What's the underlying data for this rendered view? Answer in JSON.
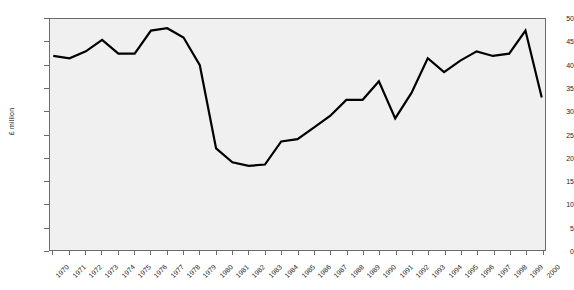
{
  "chart_data": {
    "type": "line",
    "title": "",
    "xlabel": "",
    "ylabel": "£ million",
    "ylim": [
      0,
      50
    ],
    "ytick_step": 5,
    "yticks": [
      0,
      5,
      10,
      15,
      20,
      25,
      30,
      35,
      40,
      45,
      50
    ],
    "grid": false,
    "legend": "none",
    "line_color": "#000000",
    "plot_background": "#f0f0f0",
    "axis_color": "#6b6b6b",
    "categories": [
      "1970",
      "1971",
      "1972",
      "1973",
      "1974",
      "1975",
      "1976",
      "1977",
      "1978",
      "1979",
      "1980",
      "1981",
      "1982",
      "1983",
      "1984",
      "1985",
      "1986",
      "1987",
      "1988",
      "1989",
      "1990",
      "1991",
      "1992",
      "1993",
      "1994",
      "1995",
      "1996",
      "1997",
      "1998",
      "1999",
      "2000"
    ],
    "values": [
      42.0,
      41.5,
      43.0,
      45.5,
      42.5,
      42.5,
      47.5,
      48.0,
      46.0,
      40.0,
      22.0,
      19.0,
      18.2,
      18.5,
      23.5,
      24.0,
      26.5,
      29.0,
      32.5,
      32.5,
      36.5,
      28.5,
      34.0,
      41.5,
      38.5,
      41.0,
      43.0,
      42.0,
      42.5,
      47.5,
      33.0
    ],
    "series_name": "£ million"
  }
}
